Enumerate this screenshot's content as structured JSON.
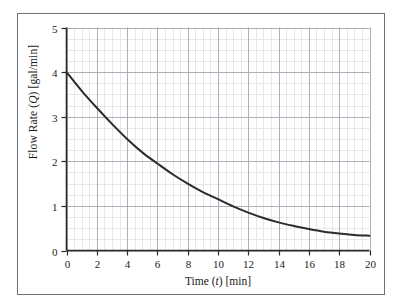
{
  "figure": {
    "background": "#ffffff",
    "frame_color": "#6f6f78"
  },
  "chart_data": {
    "type": "line",
    "title": "",
    "xlabel_parts": {
      "pre": "Time (",
      "var": "t",
      "post": ") [min]"
    },
    "ylabel_parts": {
      "pre": "Flow Rate (",
      "var": "Q",
      "post": ") [gal/min]"
    },
    "xlabel": "Time (t) [min]",
    "ylabel": "Flow Rate (Q) [gal/min]",
    "xlim": [
      0,
      20
    ],
    "ylim": [
      0,
      5
    ],
    "xticks": [
      0,
      2,
      4,
      6,
      8,
      10,
      12,
      14,
      16,
      18,
      20
    ],
    "yticks": [
      0,
      1,
      2,
      3,
      4,
      5
    ],
    "xtick_labels": [
      "0",
      "2",
      "4",
      "6",
      "8",
      "10",
      "12",
      "14",
      "16",
      "18",
      "20"
    ],
    "ytick_labels": [
      "0",
      "1",
      "2",
      "3",
      "4",
      "5"
    ],
    "x_minor_step": 0.5,
    "y_minor_step": 0.25,
    "grid": true,
    "grid_minor_color": "#dcdce2",
    "grid_major_color": "#a8a8b4",
    "legend": null,
    "series": [
      {
        "name": "Flow Rate",
        "color": "#2b2b2b",
        "line_width": 2.0,
        "x": [
          0,
          1,
          2,
          3,
          4,
          5,
          6,
          7,
          8,
          9,
          10,
          11,
          12,
          13,
          14,
          15,
          16,
          17,
          18,
          19,
          20
        ],
        "values": [
          4.0,
          3.58,
          3.2,
          2.84,
          2.5,
          2.2,
          1.95,
          1.71,
          1.5,
          1.31,
          1.15,
          0.99,
          0.85,
          0.73,
          0.63,
          0.55,
          0.48,
          0.42,
          0.38,
          0.35,
          0.33
        ]
      }
    ],
    "annotations": []
  }
}
